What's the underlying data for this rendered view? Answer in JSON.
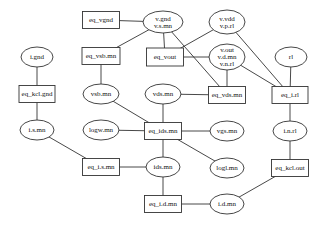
{
  "diagram": {
    "type": "bipartite constraint graph",
    "nodes": [
      {
        "id": "eq_vgnd",
        "shape": "box",
        "cx": 101,
        "cy": 20,
        "w": 37,
        "h": 17,
        "lines": [
          "eq_vgnd"
        ]
      },
      {
        "id": "v_gnd",
        "shape": "ellipse",
        "cx": 163,
        "cy": 22,
        "rx": 20,
        "ry": 11,
        "lines": [
          "v.gnd",
          "v.s.mn"
        ]
      },
      {
        "id": "v_vdd",
        "shape": "ellipse",
        "cx": 227,
        "cy": 22,
        "rx": 18,
        "ry": 12,
        "lines": [
          "v.vdd",
          "v.p.rl"
        ]
      },
      {
        "id": "eq_vsb_mn",
        "shape": "box",
        "cx": 101,
        "cy": 56,
        "w": 38,
        "h": 17,
        "lines": [
          "eq_vsb.mn"
        ]
      },
      {
        "id": "eq_vout",
        "shape": "box",
        "cx": 165,
        "cy": 57,
        "w": 37,
        "h": 18,
        "lines": [
          "eq_vout"
        ]
      },
      {
        "id": "v_out",
        "shape": "ellipse",
        "cx": 227,
        "cy": 57,
        "rx": 18,
        "ry": 13,
        "lines": [
          "v.out",
          "v.d.mn",
          "v.n.rl"
        ]
      },
      {
        "id": "rl",
        "shape": "ellipse",
        "cx": 291,
        "cy": 57,
        "rx": 16,
        "ry": 10,
        "lines": [
          "rl"
        ]
      },
      {
        "id": "i_gnd",
        "shape": "ellipse",
        "cx": 37,
        "cy": 57,
        "rx": 16,
        "ry": 10,
        "lines": [
          "i.gnd"
        ]
      },
      {
        "id": "eq_kcl_gnd",
        "shape": "box",
        "cx": 37,
        "cy": 94,
        "w": 36,
        "h": 17,
        "lines": [
          "eq_kcl.gnd"
        ]
      },
      {
        "id": "vsb_mn",
        "shape": "ellipse",
        "cx": 101,
        "cy": 94,
        "rx": 18,
        "ry": 10,
        "lines": [
          "vsb.mn"
        ]
      },
      {
        "id": "vds_mn",
        "shape": "ellipse",
        "cx": 163,
        "cy": 94,
        "rx": 18,
        "ry": 10,
        "lines": [
          "vds.mn"
        ]
      },
      {
        "id": "eq_vds_mn",
        "shape": "box",
        "cx": 227,
        "cy": 95,
        "w": 37,
        "h": 17,
        "lines": [
          "eq_vds.mn"
        ]
      },
      {
        "id": "eq_i_rl",
        "shape": "box",
        "cx": 290,
        "cy": 95,
        "w": 36,
        "h": 17,
        "lines": [
          "eq_i.rl"
        ]
      },
      {
        "id": "i_s_mn",
        "shape": "ellipse",
        "cx": 37,
        "cy": 130,
        "rx": 17,
        "ry": 10,
        "lines": [
          "i.s.mn"
        ]
      },
      {
        "id": "logw_mn",
        "shape": "ellipse",
        "cx": 101,
        "cy": 130,
        "rx": 18,
        "ry": 10,
        "lines": [
          "logw.mn"
        ]
      },
      {
        "id": "eq_ids_mn",
        "shape": "box",
        "cx": 163,
        "cy": 131,
        "w": 37,
        "h": 17,
        "lines": [
          "eq_ids.mn"
        ]
      },
      {
        "id": "vgs_mn",
        "shape": "ellipse",
        "cx": 227,
        "cy": 131,
        "rx": 17,
        "ry": 10,
        "lines": [
          "vgs.mn"
        ]
      },
      {
        "id": "i_n_rl",
        "shape": "ellipse",
        "cx": 290,
        "cy": 131,
        "rx": 17,
        "ry": 10,
        "lines": [
          "i.n.rl"
        ]
      },
      {
        "id": "eq_i_s_mn",
        "shape": "box",
        "cx": 101,
        "cy": 167,
        "w": 37,
        "h": 17,
        "lines": [
          "eq_i.s.mn"
        ]
      },
      {
        "id": "ids_mn",
        "shape": "ellipse",
        "cx": 163,
        "cy": 167,
        "rx": 17,
        "ry": 10,
        "lines": [
          "ids.mn"
        ]
      },
      {
        "id": "logl_mn",
        "shape": "ellipse",
        "cx": 227,
        "cy": 168,
        "rx": 17,
        "ry": 10,
        "lines": [
          "logl.mn"
        ]
      },
      {
        "id": "eq_kcl_out",
        "shape": "box",
        "cx": 290,
        "cy": 168,
        "w": 37,
        "h": 17,
        "lines": [
          "eq_kcl.out"
        ]
      },
      {
        "id": "eq_i_d_mn",
        "shape": "box",
        "cx": 163,
        "cy": 204,
        "w": 37,
        "h": 17,
        "lines": [
          "eq_i.d.mn"
        ]
      },
      {
        "id": "i_d_mn",
        "shape": "ellipse",
        "cx": 227,
        "cy": 204,
        "rx": 17,
        "ry": 10,
        "lines": [
          "i.d.mn"
        ]
      }
    ],
    "edges": [
      [
        "eq_vgnd",
        "v_gnd"
      ],
      [
        "v_gnd",
        "eq_vsb_mn"
      ],
      [
        "v_gnd",
        "eq_vout"
      ],
      [
        "v_gnd",
        "eq_vds_mn"
      ],
      [
        "v_vdd",
        "eq_vout"
      ],
      [
        "v_vdd",
        "eq_i_rl"
      ],
      [
        "eq_vout",
        "v_out"
      ],
      [
        "v_out",
        "eq_vds_mn"
      ],
      [
        "v_out",
        "eq_i_rl"
      ],
      [
        "rl",
        "eq_i_rl"
      ],
      [
        "i_gnd",
        "eq_kcl_gnd"
      ],
      [
        "eq_kcl_gnd",
        "i_s_mn"
      ],
      [
        "eq_vsb_mn",
        "vsb_mn"
      ],
      [
        "vsb_mn",
        "eq_ids_mn"
      ],
      [
        "vds_mn",
        "eq_vds_mn"
      ],
      [
        "vds_mn",
        "eq_ids_mn"
      ],
      [
        "eq_i_rl",
        "i_n_rl"
      ],
      [
        "logw_mn",
        "eq_ids_mn"
      ],
      [
        "eq_ids_mn",
        "vgs_mn"
      ],
      [
        "eq_ids_mn",
        "logl_mn"
      ],
      [
        "eq_ids_mn",
        "ids_mn"
      ],
      [
        "i_s_mn",
        "eq_i_s_mn"
      ],
      [
        "eq_i_s_mn",
        "ids_mn"
      ],
      [
        "i_n_rl",
        "eq_kcl_out"
      ],
      [
        "ids_mn",
        "eq_i_d_mn"
      ],
      [
        "eq_i_d_mn",
        "i_d_mn"
      ],
      [
        "i_d_mn",
        "eq_kcl_out"
      ]
    ]
  }
}
